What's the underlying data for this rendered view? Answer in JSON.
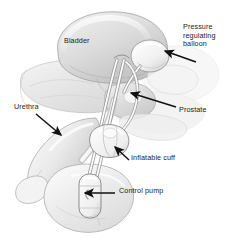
{
  "figure": {
    "background_color": "#ffffff",
    "text_color": "#1c1c1c",
    "width": 238,
    "height": 241
  },
  "labels": {
    "bladder": "Bladder",
    "balloon_line1": "Pressure",
    "balloon_line2": "regulating",
    "balloon_line3": "balloon",
    "urethra": "Urethra",
    "prostate": "Prostate",
    "cuff": "Inflatable cuff",
    "pump": "Control pump"
  },
  "anatomy": {
    "parts": [
      "bladder",
      "prostate",
      "urethra",
      "pelvic-bone",
      "penis",
      "scrotum"
    ],
    "tone_light": "#f2f2f2",
    "tone_mid": "#d8d8d8",
    "tone_shadow": "#b6b6b6",
    "outline": "#8c8c8c"
  },
  "device": {
    "components": [
      "pressure-regulating-balloon",
      "inflatable-cuff",
      "control-pump",
      "connecting-tubing"
    ],
    "fill": "#f6f6f6",
    "outline": "#7d7d7d"
  },
  "arrows": {
    "color": "#111111",
    "items": [
      {
        "name": "balloon-arrow",
        "from": [
          196,
          62
        ],
        "to": [
          163,
          50
        ]
      },
      {
        "name": "prostate-arrow",
        "from": [
          176,
          107
        ],
        "to": [
          129,
          92
        ]
      },
      {
        "name": "urethra-arrow",
        "from": [
          36,
          114
        ],
        "to": [
          62,
          136
        ]
      },
      {
        "name": "cuff-arrow",
        "from": [
          129,
          160
        ],
        "to": [
          113,
          146
        ]
      },
      {
        "name": "pump-arrow",
        "from": [
          115,
          193
        ],
        "to": [
          83,
          193
        ]
      }
    ]
  }
}
